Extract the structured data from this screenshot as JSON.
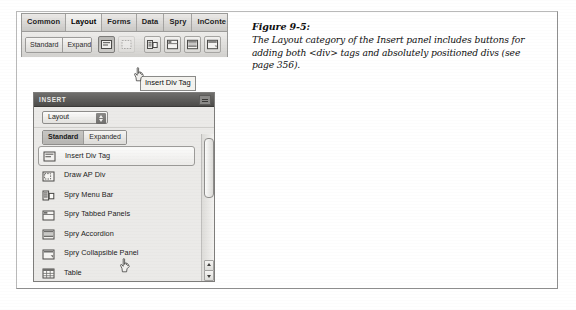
{
  "figure": {
    "caption_title": "Figure 9-5:",
    "caption_body": "The Layout category of the Insert panel includes buttons for adding both <div> tags and absolutely positioned divs (see page 356)."
  },
  "insert_bar": {
    "tabs": [
      {
        "label": "Common",
        "active": false
      },
      {
        "label": "Layout",
        "active": true
      },
      {
        "label": "Forms",
        "active": false
      },
      {
        "label": "Data",
        "active": false
      },
      {
        "label": "Spry",
        "active": false
      },
      {
        "label": "InConte",
        "active": false
      }
    ],
    "mode_buttons": [
      {
        "label": "Standard",
        "selected": false
      },
      {
        "label": "Expanded",
        "selected": false
      }
    ],
    "tool_buttons": [
      {
        "name": "insert-div-tag",
        "pressed": true
      },
      {
        "name": "draw-ap-div",
        "pressed": false
      },
      {
        "name": "spry-menu-bar",
        "pressed": false
      },
      {
        "name": "spry-tabbed-panels",
        "pressed": false
      },
      {
        "name": "spry-accordion",
        "pressed": false
      },
      {
        "name": "spry-collapsible-panel",
        "pressed": false
      }
    ],
    "tooltip": "Insert Div Tag"
  },
  "insert_panel": {
    "header_title": "INSERT",
    "category": "Layout",
    "mode_buttons": [
      {
        "label": "Standard",
        "selected": true
      },
      {
        "label": "Expanded",
        "selected": false
      }
    ],
    "items": [
      {
        "label": "Insert Div Tag",
        "icon": "insert-div-tag-icon",
        "selected": true
      },
      {
        "label": "Draw AP Div",
        "icon": "draw-ap-div-icon",
        "selected": false
      },
      {
        "label": "Spry Menu Bar",
        "icon": "spry-menu-bar-icon",
        "selected": false
      },
      {
        "label": "Spry Tabbed Panels",
        "icon": "spry-tabbed-panels-icon",
        "selected": false
      },
      {
        "label": "Spry Accordion",
        "icon": "spry-accordion-icon",
        "selected": false
      },
      {
        "label": "Spry Collapsible Panel",
        "icon": "spry-collapsible-panel-icon",
        "selected": false
      },
      {
        "label": "Table",
        "icon": "table-icon",
        "selected": false
      }
    ]
  }
}
